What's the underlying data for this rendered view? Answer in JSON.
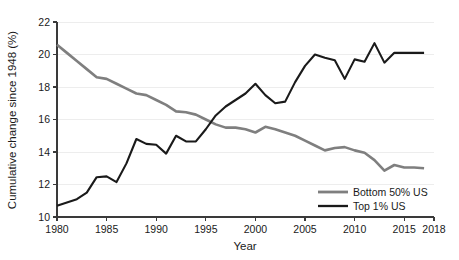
{
  "chart_data": {
    "type": "line",
    "title": "",
    "xlabel": "Year",
    "ylabel": "Cumulative change since 1948 (%)",
    "xlim": [
      1980,
      2018
    ],
    "ylim": [
      10,
      22
    ],
    "grid": true,
    "legend_position": "bottom-right",
    "x_ticks": [
      1980,
      1985,
      1990,
      1995,
      2000,
      2005,
      2010,
      2015,
      2018
    ],
    "x_tick_labels": [
      "1980",
      "1985",
      "1990",
      "1995",
      "2000",
      "2005",
      "2010",
      "2015",
      "2018"
    ],
    "y_ticks": [
      10,
      12,
      14,
      16,
      18,
      20,
      22
    ],
    "y_tick_labels": [
      "10",
      "12",
      "14",
      "16",
      "18",
      "20",
      "22"
    ],
    "x": [
      1980,
      1981,
      1982,
      1983,
      1984,
      1985,
      1986,
      1987,
      1988,
      1989,
      1990,
      1991,
      1992,
      1993,
      1994,
      1995,
      1996,
      1997,
      1998,
      1999,
      2000,
      2001,
      2002,
      2003,
      2004,
      2005,
      2006,
      2007,
      2008,
      2009,
      2010,
      2011,
      2012,
      2013,
      2014,
      2015,
      2016,
      2017
    ],
    "series": [
      {
        "name": "Bottom 50% US",
        "color": "#7f7f7f",
        "values": [
          20.6,
          20.1,
          19.6,
          19.1,
          18.6,
          18.5,
          18.2,
          17.9,
          17.6,
          17.5,
          17.2,
          16.9,
          16.5,
          16.45,
          16.3,
          16.0,
          15.7,
          15.5,
          15.5,
          15.4,
          15.2,
          15.55,
          15.4,
          15.2,
          15.0,
          14.7,
          14.4,
          14.1,
          14.25,
          14.3,
          14.1,
          13.95,
          13.5,
          12.85,
          13.2,
          13.05,
          13.05,
          13.0
        ]
      },
      {
        "name": "Top 1% US",
        "color": "#1a1a1a",
        "values": [
          10.7,
          10.9,
          11.1,
          11.5,
          12.45,
          12.5,
          12.15,
          13.3,
          14.8,
          14.5,
          14.45,
          13.9,
          15.0,
          14.65,
          14.65,
          15.4,
          16.25,
          16.8,
          17.2,
          17.6,
          18.2,
          17.5,
          17.0,
          17.1,
          18.3,
          19.3,
          20.0,
          19.8,
          19.65,
          18.5,
          19.7,
          19.55,
          20.7,
          19.5,
          20.1,
          20.1,
          20.1,
          20.1
        ]
      }
    ]
  },
  "legend": {
    "items": [
      {
        "label": "Bottom 50% US",
        "color": "#7f7f7f"
      },
      {
        "label": "Top 1% US",
        "color": "#1a1a1a"
      }
    ]
  }
}
